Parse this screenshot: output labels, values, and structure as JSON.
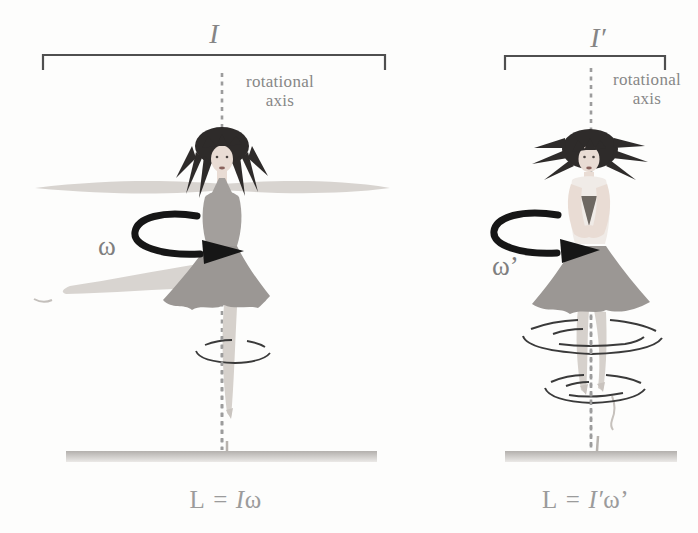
{
  "figure_left": {
    "inertia_label": "I",
    "axis_label_line1": "rotational",
    "axis_label_line2": "axis",
    "omega_label": "ω",
    "equation": {
      "lhs": "L",
      "sign": "=",
      "inertia": "I",
      "omega": "ω"
    }
  },
  "figure_right": {
    "inertia_label": "I′",
    "axis_label_line1": "rotational",
    "axis_label_line2": "axis",
    "omega_label": "ω’",
    "equation": {
      "lhs": "L",
      "sign": "=",
      "inertia": "I′",
      "omega": "ω’"
    }
  },
  "colors": {
    "arrow": "#161616",
    "bracket": "#4f4f4f",
    "axis_dash": "#9c9c9c",
    "label_gray": "#878787",
    "equation_gray": "#9b9b9b",
    "hair": "#2e2b2a",
    "skin": "#e9dcd4",
    "features": "#4a4340",
    "lips": "#8a625c",
    "dress": "#a39f9c",
    "skirt": "#9b9794",
    "top_light": "#f0ebe7",
    "neck_v": "#6e6862",
    "limb_blur": "#d8d4d0",
    "leg": "#d6d1cc",
    "spin_line": "#3a3a3a",
    "floor": "#b3b0ad"
  }
}
